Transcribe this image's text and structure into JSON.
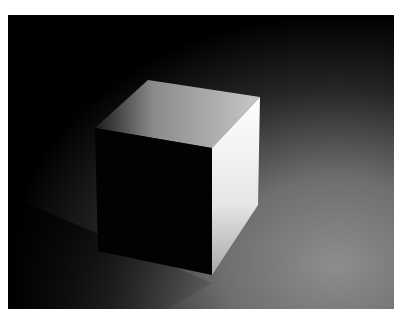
{
  "image": {
    "subject": "Rendered 3D cube under a single light on a gradient floor",
    "colors": {
      "background_dark": "#000000",
      "floor_light": "#8a8a8a",
      "top_face": "#b5b5b5",
      "right_face": "#f2f2f2",
      "front_face": "#020202",
      "border": "#ffffff"
    }
  }
}
